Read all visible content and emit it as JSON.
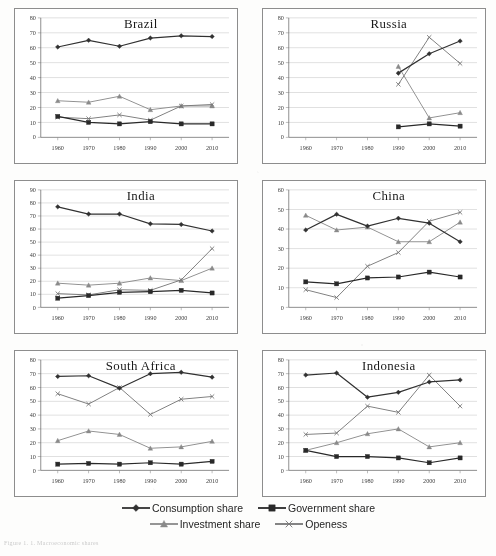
{
  "figure": {
    "caption": "Figure 1. 1. Macroeconomic shares",
    "x_ticks": [
      "1960",
      "1970",
      "1980",
      "1990",
      "2000",
      "2010"
    ],
    "series_styles": {
      "consumption": {
        "marker": "diamond",
        "color": "#333333"
      },
      "government": {
        "marker": "square",
        "color": "#2b2b2b"
      },
      "investment": {
        "marker": "triangle",
        "color": "#8a8a8a"
      },
      "openess": {
        "marker": "cross",
        "color": "#777777"
      }
    }
  },
  "legend": {
    "rows": [
      [
        {
          "label": "Consumption share",
          "marker": "diamond",
          "color": "#333333"
        },
        {
          "label": "Government share",
          "marker": "square",
          "color": "#2b2b2b"
        }
      ],
      [
        {
          "label": "Investment share",
          "marker": "triangle",
          "color": "#8a8a8a"
        },
        {
          "label": "Openess",
          "marker": "cross",
          "color": "#777777"
        }
      ]
    ]
  },
  "chart_data": [
    {
      "type": "line",
      "title": "Brazil",
      "xlabel": "",
      "ylabel": "",
      "x": [
        1960,
        1970,
        1980,
        1990,
        2000,
        2010
      ],
      "xtick_labels": [
        "1960",
        "1970",
        "1980",
        "1990",
        "2000",
        "2010"
      ],
      "ylim": [
        0,
        80
      ],
      "ytick_step": 10,
      "grid": true,
      "series": [
        {
          "name": "Consumption share",
          "marker": "diamond",
          "color": "#333333",
          "values": [
            60.5,
            65.0,
            61.0,
            66.5,
            68.0,
            67.5
          ]
        },
        {
          "name": "Government share",
          "marker": "square",
          "color": "#2b2b2b",
          "values": [
            14.0,
            10.0,
            9.0,
            10.5,
            9.0,
            9.0
          ]
        },
        {
          "name": "Investment share",
          "marker": "triangle",
          "color": "#8a8a8a",
          "values": [
            24.5,
            23.5,
            27.5,
            18.5,
            21.0,
            21.0
          ]
        },
        {
          "name": "Openess",
          "marker": "cross",
          "color": "#777777",
          "values": [
            13.5,
            12.5,
            15.0,
            11.5,
            21.0,
            22.0
          ]
        }
      ]
    },
    {
      "type": "line",
      "title": "Russia",
      "xlabel": "",
      "ylabel": "",
      "x": [
        1960,
        1970,
        1980,
        1990,
        2000,
        2010
      ],
      "xtick_labels": [
        "1960",
        "1970",
        "1980",
        "1990",
        "2000",
        "2010"
      ],
      "ylim": [
        0,
        80
      ],
      "ytick_step": 10,
      "grid": true,
      "series": [
        {
          "name": "Consumption share",
          "marker": "diamond",
          "color": "#333333",
          "values": [
            null,
            null,
            null,
            43.0,
            56.0,
            64.5
          ]
        },
        {
          "name": "Government share",
          "marker": "square",
          "color": "#2b2b2b",
          "values": [
            null,
            null,
            null,
            7.0,
            9.0,
            7.5
          ]
        },
        {
          "name": "Investment share",
          "marker": "triangle",
          "color": "#8a8a8a",
          "values": [
            null,
            null,
            null,
            47.5,
            13.0,
            16.5
          ]
        },
        {
          "name": "Openess",
          "marker": "cross",
          "color": "#777777",
          "values": [
            null,
            null,
            null,
            35.5,
            67.0,
            49.5
          ]
        }
      ]
    },
    {
      "type": "line",
      "title": "India",
      "xlabel": "",
      "ylabel": "",
      "x": [
        1960,
        1970,
        1980,
        1990,
        2000,
        2010
      ],
      "xtick_labels": [
        "1960",
        "1970",
        "1980",
        "1990",
        "2000",
        "2010"
      ],
      "ylim": [
        0,
        90
      ],
      "ytick_step": 10,
      "grid": true,
      "series": [
        {
          "name": "Consumption share",
          "marker": "diamond",
          "color": "#333333",
          "values": [
            77.0,
            71.5,
            71.5,
            64.0,
            63.5,
            58.5
          ]
        },
        {
          "name": "Government share",
          "marker": "square",
          "color": "#2b2b2b",
          "values": [
            7.0,
            9.0,
            11.5,
            12.0,
            13.0,
            11.0
          ]
        },
        {
          "name": "Investment share",
          "marker": "triangle",
          "color": "#8a8a8a",
          "values": [
            18.5,
            17.0,
            18.5,
            22.5,
            20.5,
            30.0
          ]
        },
        {
          "name": "Openess",
          "marker": "cross",
          "color": "#777777",
          "values": [
            10.5,
            9.5,
            13.5,
            13.0,
            21.0,
            45.0
          ]
        }
      ]
    },
    {
      "type": "line",
      "title": "China",
      "xlabel": "",
      "ylabel": "",
      "x": [
        1960,
        1970,
        1980,
        1990,
        2000,
        2010
      ],
      "xtick_labels": [
        "1960",
        "1970",
        "1980",
        "1990",
        "2000",
        "2010"
      ],
      "ylim": [
        0,
        60
      ],
      "ytick_step": 10,
      "grid": true,
      "series": [
        {
          "name": "Consumption share",
          "marker": "diamond",
          "color": "#333333",
          "values": [
            39.5,
            47.5,
            41.5,
            45.5,
            43.0,
            33.5
          ]
        },
        {
          "name": "Government share",
          "marker": "square",
          "color": "#2b2b2b",
          "values": [
            13.0,
            12.0,
            15.0,
            15.5,
            18.0,
            15.5
          ]
        },
        {
          "name": "Investment share",
          "marker": "triangle",
          "color": "#8a8a8a",
          "values": [
            47.0,
            39.5,
            41.0,
            33.5,
            33.5,
            43.5
          ]
        },
        {
          "name": "Openess",
          "marker": "cross",
          "color": "#777777",
          "values": [
            9.0,
            5.0,
            21.0,
            28.0,
            44.0,
            48.5
          ]
        }
      ]
    },
    {
      "type": "line",
      "title": "South Africa",
      "xlabel": "",
      "ylabel": "",
      "x": [
        1960,
        1970,
        1980,
        1990,
        2000,
        2010
      ],
      "xtick_labels": [
        "1960",
        "1970",
        "1980",
        "1990",
        "2000",
        "2010"
      ],
      "ylim": [
        0,
        80
      ],
      "ytick_step": 10,
      "grid": true,
      "series": [
        {
          "name": "Consumption share",
          "marker": "diamond",
          "color": "#333333",
          "values": [
            68.0,
            68.5,
            59.5,
            70.0,
            71.0,
            67.5
          ]
        },
        {
          "name": "Government share",
          "marker": "square",
          "color": "#2b2b2b",
          "values": [
            4.5,
            5.0,
            4.5,
            5.5,
            4.5,
            6.5
          ]
        },
        {
          "name": "Investment share",
          "marker": "triangle",
          "color": "#8a8a8a",
          "values": [
            21.5,
            28.5,
            26.0,
            16.0,
            17.0,
            21.0
          ]
        },
        {
          "name": "Openess",
          "marker": "cross",
          "color": "#777777",
          "values": [
            55.5,
            48.0,
            60.0,
            40.5,
            51.5,
            53.5
          ]
        }
      ]
    },
    {
      "type": "line",
      "title": "Indonesia",
      "xlabel": "",
      "ylabel": "",
      "x": [
        1960,
        1970,
        1980,
        1990,
        2000,
        2010
      ],
      "xtick_labels": [
        "1960",
        "1970",
        "1980",
        "1990",
        "2000",
        "2010"
      ],
      "ylim": [
        0,
        80
      ],
      "ytick_step": 10,
      "grid": true,
      "series": [
        {
          "name": "Consumption share",
          "marker": "diamond",
          "color": "#333333",
          "values": [
            69.0,
            70.5,
            53.0,
            56.5,
            64.0,
            65.5
          ]
        },
        {
          "name": "Government share",
          "marker": "square",
          "color": "#2b2b2b",
          "values": [
            14.5,
            10.0,
            10.0,
            9.0,
            5.5,
            9.0
          ]
        },
        {
          "name": "Investment share",
          "marker": "triangle",
          "color": "#8a8a8a",
          "values": [
            14.5,
            20.0,
            26.5,
            30.0,
            17.0,
            20.0
          ]
        },
        {
          "name": "Openess",
          "marker": "cross",
          "color": "#777777",
          "values": [
            26.0,
            27.0,
            46.5,
            42.0,
            69.0,
            46.5
          ]
        }
      ]
    }
  ]
}
